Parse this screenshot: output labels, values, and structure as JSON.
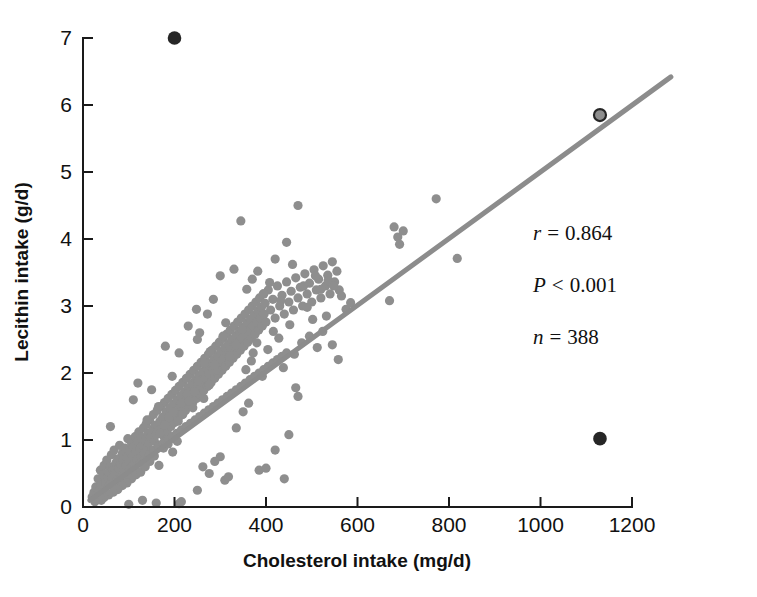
{
  "chart_data": {
    "type": "scatter",
    "title": "",
    "xlabel": "Cholesterol intake (mg/d)",
    "ylabel": "Lecithin intake (g/d)",
    "xlim": [
      0,
      1200
    ],
    "ylim": [
      0,
      7.35
    ],
    "xticks": [
      0,
      200,
      400,
      600,
      800,
      1000,
      1200
    ],
    "xtick_labels": [
      "0",
      "200",
      "400",
      "600",
      "800",
      "1000",
      "1200"
    ],
    "yticks": [
      0,
      1,
      2,
      3,
      4,
      5,
      6,
      7
    ],
    "ytick_labels": [
      "0",
      "1",
      "2",
      "3",
      "4",
      "5",
      "6",
      "7"
    ],
    "grid": false,
    "legend": null,
    "point_color": "#8e8e8e",
    "outlier_color": "#262626",
    "line_color": "#8c8c8c",
    "regression_line": {
      "label": "least-squares fit",
      "x": [
        15,
        1285
      ],
      "y": [
        0.1,
        6.42
      ],
      "slope": 0.004976,
      "intercept": 0.0254
    },
    "annotations": [
      {
        "name": "correlation",
        "symbol": "r",
        "relation": "=",
        "value": "0.864",
        "text": "r = 0.864"
      },
      {
        "name": "p-value",
        "symbol": "P",
        "relation": "<",
        "value": "0.001",
        "text": "P < 0.001"
      },
      {
        "name": "sample-size",
        "symbol": "n",
        "relation": "=",
        "value": "388",
        "text": "n = 388"
      }
    ],
    "n": 388,
    "highlighted_points": [
      {
        "x": 200,
        "y": 7.0,
        "style": "dark-filled"
      },
      {
        "x": 1130,
        "y": 1.02,
        "style": "dark-filled"
      },
      {
        "x": 1130,
        "y": 5.85,
        "style": "gray-fill-dark-ring"
      }
    ],
    "points": [
      [
        20,
        0.15
      ],
      [
        24,
        0.22
      ],
      [
        28,
        0.3
      ],
      [
        30,
        0.12
      ],
      [
        33,
        0.42
      ],
      [
        36,
        0.25
      ],
      [
        38,
        0.55
      ],
      [
        40,
        0.33
      ],
      [
        42,
        0.18
      ],
      [
        44,
        0.48
      ],
      [
        46,
        0.62
      ],
      [
        48,
        0.28
      ],
      [
        50,
        0.38
      ],
      [
        52,
        0.7
      ],
      [
        54,
        0.45
      ],
      [
        56,
        0.52
      ],
      [
        58,
        0.33
      ],
      [
        60,
        0.6
      ],
      [
        62,
        0.78
      ],
      [
        64,
        0.44
      ],
      [
        66,
        0.56
      ],
      [
        68,
        0.85
      ],
      [
        70,
        0.5
      ],
      [
        72,
        0.66
      ],
      [
        74,
        0.4
      ],
      [
        76,
        0.72
      ],
      [
        78,
        0.58
      ],
      [
        80,
        0.92
      ],
      [
        82,
        0.64
      ],
      [
        84,
        0.46
      ],
      [
        86,
        0.8
      ],
      [
        88,
        0.7
      ],
      [
        90,
        0.55
      ],
      [
        92,
        0.88
      ],
      [
        94,
        0.62
      ],
      [
        96,
        0.74
      ],
      [
        98,
        1.02
      ],
      [
        100,
        0.68
      ],
      [
        102,
        0.84
      ],
      [
        104,
        0.58
      ],
      [
        106,
        0.96
      ],
      [
        108,
        0.76
      ],
      [
        110,
        0.9
      ],
      [
        112,
        0.64
      ],
      [
        114,
        1.05
      ],
      [
        116,
        0.82
      ],
      [
        118,
        0.7
      ],
      [
        120,
        0.98
      ],
      [
        122,
        1.12
      ],
      [
        124,
        0.86
      ],
      [
        126,
        0.74
      ],
      [
        128,
        1.04
      ],
      [
        130,
        0.92
      ],
      [
        132,
        1.18
      ],
      [
        134,
        0.8
      ],
      [
        136,
        1.0
      ],
      [
        138,
        1.24
      ],
      [
        140,
        0.88
      ],
      [
        142,
        1.1
      ],
      [
        144,
        0.96
      ],
      [
        146,
        1.3
      ],
      [
        148,
        1.05
      ],
      [
        150,
        0.84
      ],
      [
        152,
        1.16
      ],
      [
        154,
        1.38
      ],
      [
        156,
        0.98
      ],
      [
        158,
        1.22
      ],
      [
        160,
        1.08
      ],
      [
        162,
        1.44
      ],
      [
        164,
        1.14
      ],
      [
        166,
        0.92
      ],
      [
        168,
        1.28
      ],
      [
        170,
        1.5
      ],
      [
        172,
        1.18
      ],
      [
        174,
        1.34
      ],
      [
        176,
        1.06
      ],
      [
        178,
        1.56
      ],
      [
        180,
        1.24
      ],
      [
        182,
        1.42
      ],
      [
        184,
        1.12
      ],
      [
        186,
        1.62
      ],
      [
        188,
        1.3
      ],
      [
        190,
        1.48
      ],
      [
        192,
        1.2
      ],
      [
        194,
        1.68
      ],
      [
        196,
        1.36
      ],
      [
        198,
        1.54
      ],
      [
        200,
        1.26
      ],
      [
        202,
        1.74
      ],
      [
        204,
        1.42
      ],
      [
        206,
        1.6
      ],
      [
        208,
        1.32
      ],
      [
        210,
        1.8
      ],
      [
        212,
        1.5
      ],
      [
        214,
        1.66
      ],
      [
        216,
        1.38
      ],
      [
        218,
        1.86
      ],
      [
        220,
        1.56
      ],
      [
        222,
        1.72
      ],
      [
        224,
        1.44
      ],
      [
        226,
        1.92
      ],
      [
        228,
        1.62
      ],
      [
        230,
        1.78
      ],
      [
        232,
        1.5
      ],
      [
        234,
        1.98
      ],
      [
        236,
        1.68
      ],
      [
        238,
        1.84
      ],
      [
        240,
        1.56
      ],
      [
        242,
        2.04
      ],
      [
        244,
        1.74
      ],
      [
        246,
        1.9
      ],
      [
        248,
        1.62
      ],
      [
        250,
        2.1
      ],
      [
        252,
        1.8
      ],
      [
        254,
        1.96
      ],
      [
        256,
        1.68
      ],
      [
        258,
        2.16
      ],
      [
        260,
        1.86
      ],
      [
        262,
        2.02
      ],
      [
        264,
        1.74
      ],
      [
        266,
        2.22
      ],
      [
        268,
        1.92
      ],
      [
        270,
        2.08
      ],
      [
        272,
        1.8
      ],
      [
        274,
        2.28
      ],
      [
        276,
        1.98
      ],
      [
        278,
        2.14
      ],
      [
        280,
        1.86
      ],
      [
        282,
        2.34
      ],
      [
        284,
        2.04
      ],
      [
        286,
        2.2
      ],
      [
        288,
        1.92
      ],
      [
        290,
        2.4
      ],
      [
        292,
        2.1
      ],
      [
        294,
        2.26
      ],
      [
        296,
        1.98
      ],
      [
        298,
        2.46
      ],
      [
        300,
        2.16
      ],
      [
        302,
        2.32
      ],
      [
        304,
        2.04
      ],
      [
        306,
        2.52
      ],
      [
        308,
        2.22
      ],
      [
        310,
        2.38
      ],
      [
        312,
        2.1
      ],
      [
        314,
        2.58
      ],
      [
        316,
        2.28
      ],
      [
        318,
        2.44
      ],
      [
        320,
        2.16
      ],
      [
        322,
        2.64
      ],
      [
        324,
        2.34
      ],
      [
        326,
        2.5
      ],
      [
        328,
        2.22
      ],
      [
        330,
        2.7
      ],
      [
        332,
        2.4
      ],
      [
        334,
        2.56
      ],
      [
        336,
        2.28
      ],
      [
        338,
        2.76
      ],
      [
        340,
        2.46
      ],
      [
        342,
        2.62
      ],
      [
        344,
        2.34
      ],
      [
        346,
        2.82
      ],
      [
        348,
        2.52
      ],
      [
        350,
        2.68
      ],
      [
        352,
        2.4
      ],
      [
        354,
        2.88
      ],
      [
        356,
        2.58
      ],
      [
        358,
        2.74
      ],
      [
        360,
        2.46
      ],
      [
        362,
        2.94
      ],
      [
        364,
        2.64
      ],
      [
        366,
        2.8
      ],
      [
        368,
        2.52
      ],
      [
        370,
        3.0
      ],
      [
        372,
        2.7
      ],
      [
        374,
        2.86
      ],
      [
        376,
        2.58
      ],
      [
        378,
        3.06
      ],
      [
        380,
        2.76
      ],
      [
        382,
        2.92
      ],
      [
        384,
        2.64
      ],
      [
        386,
        3.12
      ],
      [
        388,
        2.82
      ],
      [
        390,
        2.98
      ],
      [
        392,
        2.7
      ],
      [
        394,
        3.18
      ],
      [
        396,
        2.88
      ],
      [
        398,
        3.04
      ],
      [
        400,
        2.76
      ],
      [
        405,
        3.24
      ],
      [
        410,
        2.94
      ],
      [
        415,
        3.1
      ],
      [
        420,
        2.82
      ],
      [
        425,
        3.3
      ],
      [
        430,
        3.0
      ],
      [
        435,
        3.16
      ],
      [
        440,
        2.88
      ],
      [
        445,
        3.36
      ],
      [
        450,
        3.06
      ],
      [
        455,
        3.22
      ],
      [
        460,
        2.94
      ],
      [
        465,
        3.42
      ],
      [
        470,
        3.12
      ],
      [
        475,
        3.28
      ],
      [
        480,
        3.0
      ],
      [
        485,
        3.48
      ],
      [
        490,
        3.18
      ],
      [
        495,
        3.34
      ],
      [
        500,
        3.06
      ],
      [
        505,
        3.54
      ],
      [
        510,
        3.24
      ],
      [
        515,
        3.4
      ],
      [
        520,
        3.12
      ],
      [
        525,
        3.6
      ],
      [
        530,
        3.3
      ],
      [
        535,
        3.46
      ],
      [
        540,
        3.18
      ],
      [
        545,
        3.66
      ],
      [
        550,
        3.36
      ],
      [
        555,
        3.52
      ],
      [
        560,
        3.24
      ],
      [
        40,
        0.1
      ],
      [
        55,
        0.2
      ],
      [
        70,
        0.3
      ],
      [
        85,
        0.35
      ],
      [
        95,
        0.45
      ],
      [
        105,
        0.5
      ],
      [
        115,
        0.55
      ],
      [
        125,
        0.65
      ],
      [
        135,
        0.72
      ],
      [
        145,
        0.78
      ],
      [
        155,
        0.85
      ],
      [
        165,
        0.9
      ],
      [
        175,
        0.95
      ],
      [
        185,
        1.0
      ],
      [
        195,
        1.05
      ],
      [
        205,
        1.1
      ],
      [
        215,
        1.15
      ],
      [
        225,
        1.2
      ],
      [
        235,
        1.25
      ],
      [
        245,
        1.3
      ],
      [
        255,
        1.35
      ],
      [
        265,
        1.4
      ],
      [
        275,
        1.45
      ],
      [
        285,
        1.5
      ],
      [
        295,
        1.55
      ],
      [
        305,
        1.6
      ],
      [
        315,
        1.65
      ],
      [
        325,
        1.7
      ],
      [
        335,
        1.75
      ],
      [
        345,
        1.8
      ],
      [
        355,
        1.85
      ],
      [
        365,
        1.9
      ],
      [
        375,
        1.95
      ],
      [
        385,
        2.0
      ],
      [
        395,
        2.05
      ],
      [
        405,
        2.1
      ],
      [
        415,
        2.15
      ],
      [
        425,
        2.2
      ],
      [
        435,
        2.25
      ],
      [
        445,
        2.3
      ],
      [
        60,
        1.2
      ],
      [
        110,
        1.6
      ],
      [
        120,
        1.85
      ],
      [
        140,
        1.3
      ],
      [
        150,
        1.75
      ],
      [
        165,
        1.5
      ],
      [
        180,
        2.4
      ],
      [
        195,
        1.95
      ],
      [
        210,
        2.3
      ],
      [
        230,
        2.7
      ],
      [
        248,
        2.95
      ],
      [
        255,
        2.6
      ],
      [
        272,
        2.88
      ],
      [
        285,
        3.1
      ],
      [
        300,
        3.45
      ],
      [
        312,
        2.75
      ],
      [
        330,
        3.55
      ],
      [
        345,
        4.27
      ],
      [
        358,
        3.25
      ],
      [
        370,
        3.4
      ],
      [
        382,
        3.52
      ],
      [
        395,
        3.18
      ],
      [
        408,
        3.35
      ],
      [
        420,
        3.7
      ],
      [
        432,
        3.08
      ],
      [
        445,
        3.95
      ],
      [
        458,
        3.62
      ],
      [
        470,
        4.5
      ],
      [
        482,
        3.3
      ],
      [
        495,
        2.55
      ],
      [
        508,
        3.45
      ],
      [
        520,
        3.25
      ],
      [
        532,
        2.85
      ],
      [
        545,
        2.42
      ],
      [
        558,
        2.2
      ],
      [
        210,
        0.05
      ],
      [
        215,
        0.08
      ],
      [
        160,
        0.06
      ],
      [
        100,
        0.04
      ],
      [
        130,
        0.1
      ],
      [
        385,
        0.55
      ],
      [
        400,
        0.58
      ],
      [
        420,
        0.85
      ],
      [
        440,
        0.42
      ],
      [
        450,
        1.08
      ],
      [
        465,
        1.78
      ],
      [
        470,
        1.65
      ],
      [
        300,
        0.75
      ],
      [
        310,
        0.4
      ],
      [
        318,
        0.45
      ],
      [
        335,
        1.18
      ],
      [
        350,
        1.42
      ],
      [
        362,
        1.55
      ],
      [
        250,
        0.25
      ],
      [
        262,
        0.6
      ],
      [
        276,
        0.5
      ],
      [
        288,
        0.68
      ],
      [
        368,
        2.18
      ],
      [
        380,
        2.45
      ],
      [
        392,
        1.95
      ],
      [
        404,
        2.35
      ],
      [
        416,
        2.62
      ],
      [
        428,
        2.52
      ],
      [
        438,
        2.08
      ],
      [
        452,
        2.72
      ],
      [
        462,
        2.28
      ],
      [
        478,
        2.45
      ],
      [
        490,
        2.98
      ],
      [
        502,
        2.8
      ],
      [
        512,
        2.38
      ],
      [
        524,
        2.62
      ],
      [
        536,
        3.38
      ],
      [
        548,
        3.3
      ],
      [
        565,
        3.15
      ],
      [
        575,
        2.95
      ],
      [
        585,
        3.05
      ],
      [
        670,
        3.08
      ],
      [
        680,
        4.18
      ],
      [
        688,
        4.03
      ],
      [
        692,
        3.92
      ],
      [
        700,
        4.12
      ],
      [
        772,
        4.6
      ],
      [
        818,
        3.71
      ],
      [
        250,
        2.5
      ],
      [
        265,
        2.15
      ],
      [
        278,
        2.32
      ],
      [
        292,
        2.05
      ],
      [
        306,
        2.55
      ],
      [
        320,
        2.25
      ],
      [
        334,
        2.42
      ],
      [
        348,
        2.65
      ],
      [
        356,
        2.05
      ],
      [
        372,
        2.3
      ],
      [
        215,
        1.55
      ],
      [
        228,
        1.68
      ],
      [
        240,
        1.48
      ],
      [
        252,
        1.88
      ],
      [
        264,
        1.62
      ],
      [
        276,
        1.82
      ],
      [
        288,
        2.12
      ],
      [
        168,
        1.1
      ],
      [
        178,
        1.22
      ],
      [
        188,
        1.34
      ],
      [
        198,
        1.42
      ],
      [
        208,
        1.28
      ],
      [
        218,
        1.38
      ],
      [
        232,
        1.58
      ],
      [
        244,
        1.72
      ],
      [
        146,
        0.68
      ],
      [
        156,
        0.76
      ],
      [
        166,
        0.62
      ],
      [
        176,
        0.88
      ],
      [
        186,
        0.94
      ],
      [
        196,
        0.82
      ],
      [
        206,
        0.98
      ],
      [
        116,
        0.48
      ],
      [
        126,
        0.52
      ],
      [
        136,
        0.6
      ],
      [
        106,
        0.42
      ],
      [
        96,
        0.36
      ],
      [
        86,
        0.32
      ],
      [
        76,
        0.26
      ],
      [
        66,
        0.22
      ],
      [
        56,
        0.18
      ],
      [
        46,
        0.14
      ],
      [
        36,
        0.16
      ],
      [
        26,
        0.08
      ]
    ]
  }
}
